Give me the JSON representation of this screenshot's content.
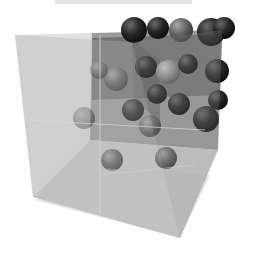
{
  "figure": {
    "colors": {
      "background": "#ffffff",
      "cube_face": "#9a9a9a",
      "cube_face_dark": "#6e6e6e",
      "cube_face_light": "#c4c4c4",
      "sphere_dark": "#1e1e1e",
      "sphere_mid": "#5a5a5a",
      "sphere_light": "#8a8a8a"
    },
    "spheres": [
      {
        "cx": 134,
        "cy": 30,
        "r": 13,
        "shade": "dark"
      },
      {
        "cx": 158,
        "cy": 28,
        "r": 11,
        "shade": "dark"
      },
      {
        "cx": 181,
        "cy": 30,
        "r": 12,
        "shade": "mid"
      },
      {
        "cx": 211,
        "cy": 32,
        "r": 14,
        "shade": "dark"
      },
      {
        "cx": 224,
        "cy": 28,
        "r": 11,
        "shade": "dark"
      },
      {
        "cx": 146,
        "cy": 67,
        "r": 11,
        "shade": "dark"
      },
      {
        "cx": 168,
        "cy": 72,
        "r": 12,
        "shade": "light"
      },
      {
        "cx": 188,
        "cy": 64,
        "r": 10,
        "shade": "dark"
      },
      {
        "cx": 217,
        "cy": 71,
        "r": 12,
        "shade": "dark"
      },
      {
        "cx": 157,
        "cy": 94,
        "r": 10,
        "shade": "dark"
      },
      {
        "cx": 133,
        "cy": 110,
        "r": 11,
        "shade": "dark"
      },
      {
        "cx": 179,
        "cy": 104,
        "r": 11,
        "shade": "dark"
      },
      {
        "cx": 218,
        "cy": 100,
        "r": 10,
        "shade": "dark"
      },
      {
        "cx": 206,
        "cy": 119,
        "r": 13,
        "shade": "dark"
      },
      {
        "cx": 116,
        "cy": 79,
        "r": 12,
        "shade": "mid"
      },
      {
        "cx": 99,
        "cy": 70,
        "r": 9,
        "shade": "mid"
      },
      {
        "cx": 150,
        "cy": 126,
        "r": 11,
        "shade": "mid"
      },
      {
        "cx": 84,
        "cy": 118,
        "r": 11,
        "shade": "mid"
      },
      {
        "cx": 112,
        "cy": 160,
        "r": 11,
        "shade": "mid"
      },
      {
        "cx": 166,
        "cy": 158,
        "r": 11,
        "shade": "mid"
      }
    ]
  }
}
